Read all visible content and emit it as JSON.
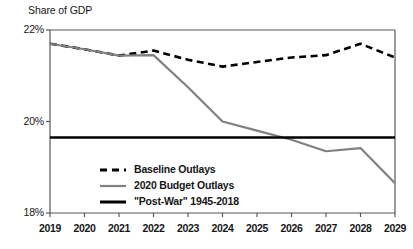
{
  "chart_data": {
    "type": "line",
    "title": "Share of GDP",
    "xlabel": "",
    "ylabel": "Share of GDP",
    "x": [
      2019,
      2020,
      2021,
      2022,
      2023,
      2024,
      2025,
      2026,
      2027,
      2028,
      2029
    ],
    "xtick_labels": [
      "2019",
      "2020",
      "2021",
      "2022",
      "2023",
      "2024",
      "2025",
      "2026",
      "2027",
      "2028",
      "2029"
    ],
    "ylim": [
      18,
      22
    ],
    "ytick_values": [
      18,
      20,
      22
    ],
    "ytick_labels": [
      "18%",
      "20%",
      "22%"
    ],
    "grid": false,
    "legend_position": "lower-left-inside",
    "series": [
      {
        "name": "Baseline Outlays",
        "style": "dashed",
        "color": "#000000",
        "values": [
          21.7,
          21.58,
          21.44,
          21.55,
          21.35,
          21.2,
          21.3,
          21.4,
          21.45,
          21.7,
          21.4
        ]
      },
      {
        "name": "2020 Budget Outlays",
        "style": "solid",
        "color": "#808080",
        "values": [
          21.7,
          21.58,
          21.44,
          21.45,
          20.75,
          20.0,
          19.8,
          19.6,
          19.35,
          19.42,
          18.65
        ]
      }
    ],
    "reference_lines": [
      {
        "name": "\"Post-War\" 1945-2018",
        "style": "solid-bold",
        "color": "#000000",
        "value": 19.65
      }
    ],
    "legend": [
      {
        "label": "Baseline Outlays",
        "style": "dashed",
        "color": "#000000"
      },
      {
        "label": "2020 Budget Outlays",
        "style": "solid",
        "color": "#808080"
      },
      {
        "label": "\"Post-War\" 1945-2018",
        "style": "solid-bold",
        "color": "#000000"
      }
    ],
    "colors": {
      "baseline": "#000000",
      "budget": "#808080",
      "postwar": "#000000",
      "axis": "#595959",
      "text": "#161616",
      "background": "#ffffff"
    }
  }
}
